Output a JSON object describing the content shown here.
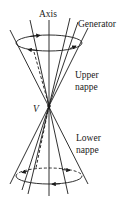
{
  "diagram": {
    "labels": {
      "axis": "Axis",
      "generator": "Generator",
      "upper_nappe_line1": "Upper",
      "upper_nappe_line2": "nappe",
      "vertex": "V",
      "lower_nappe_line1": "Lower",
      "lower_nappe_line2": "nappe"
    },
    "colors": {
      "stroke": "#1a1a1a",
      "background": "#ffffff"
    }
  }
}
